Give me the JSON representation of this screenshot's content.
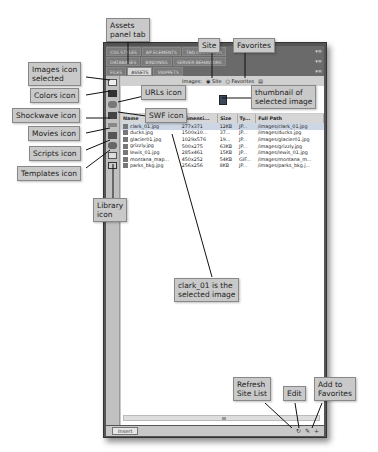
{
  "panel": {
    "tab_groups": [
      {
        "tabs": [
          "CSS STYLES",
          "AP ELEMENTS",
          "TAG INSPECTOR"
        ],
        "active": -1
      },
      {
        "tabs": [
          "DATABASES",
          "BINDINGS",
          "SERVER BEHAVIORS"
        ],
        "active": -1
      },
      {
        "tabs": [
          "FILES",
          "ASSETS",
          "SNIPPETS"
        ],
        "active": 1
      }
    ],
    "radio_label": "Images:",
    "radio_site": "Site",
    "radio_favorites": "Favorites",
    "columns": [
      "Name",
      "Dimensi...",
      "Size",
      "Ty...",
      "Full Path"
    ],
    "rows": [
      {
        "name": "clark_01.jpg",
        "dim": "277x371",
        "size": "12KB",
        "type": "JP...",
        "path": "/images/clark_01.jpg",
        "selected": true
      },
      {
        "name": "ducks.jpg",
        "dim": "1500x10...",
        "size": "37...",
        "type": "JP...",
        "path": "/images/ducks.jpg"
      },
      {
        "name": "glacier01.jpg",
        "dim": "1029x576",
        "size": "19...",
        "type": "JP...",
        "path": "/images/glacier01.jpg"
      },
      {
        "name": "grizzly.jpg",
        "dim": "500x275",
        "size": "63KB",
        "type": "JP...",
        "path": "/images/grizzly.jpg"
      },
      {
        "name": "lewis_01.jpg",
        "dim": "285x461",
        "size": "15KB",
        "type": "JP...",
        "path": "/images/lewis_01.jpg"
      },
      {
        "name": "montana_map...",
        "dim": "450x252",
        "size": "54KB",
        "type": "GIF...",
        "path": "/images/montana_m..."
      },
      {
        "name": "parks_bkg.jpg",
        "dim": "256x256",
        "size": "8KB",
        "type": "JP...",
        "path": "/images/parks_bkg.j..."
      }
    ],
    "insert_label": "Insert",
    "bottom_icons": [
      "refresh-icon",
      "edit-icon",
      "add-to-favorites-icon"
    ]
  },
  "callouts": {
    "assets_tab": "Assets\npanel tab",
    "site": "Site",
    "favorites": "Favorites",
    "images_icon": "Images icon\nselected",
    "colors_icon": "Colors icon",
    "urls_icon": "URLs icon",
    "thumbnail": "thumbnail of\nselected image",
    "shockwave_icon": "Shockwave icon",
    "swf_icon": "SWF icon",
    "movies_icon": "Movies icon",
    "scripts_icon": "Scripts icon",
    "templates_icon": "Templates icon",
    "library_icon": "Library\nicon",
    "selected_image": "clark_01 is the\nselected image",
    "refresh": "Refresh\nSite List",
    "edit": "Edit",
    "add_favorites": "Add to\nFavorites"
  }
}
